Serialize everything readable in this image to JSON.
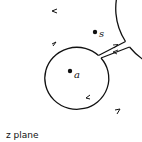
{
  "diagram": {
    "points": [
      {
        "label": "a",
        "x": 70,
        "y": 71
      },
      {
        "label": "s",
        "x": 95,
        "y": 32
      }
    ],
    "plane_label": "z plane",
    "colors": {
      "stroke": "#111111",
      "background": "#ffffff"
    }
  }
}
